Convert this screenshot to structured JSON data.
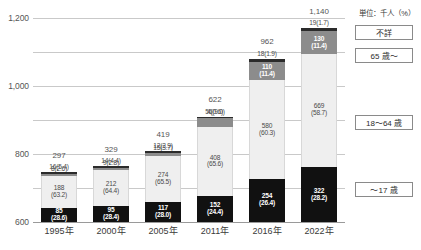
{
  "chart": {
    "type": "bar",
    "unit_note": "単位：千人（%）",
    "ylabel": "",
    "xlabel": ""
  },
  "yaxis": {
    "ticks": [
      "0",
      "200",
      "400",
      "600",
      "800",
      "1,000",
      "1,200"
    ],
    "min": 0,
    "max": 1200
  },
  "legend": {
    "items": [
      {
        "key": "unknown",
        "label": "不詳",
        "color": "#2b2b2b"
      },
      {
        "key": "age65",
        "label": "65 歳～",
        "color": "#8c8c8c"
      },
      {
        "key": "age1864",
        "label": "18～64 歳",
        "color": "#efefef"
      },
      {
        "key": "age17",
        "label": "～17 歳",
        "color": "#111111"
      }
    ]
  },
  "chart_data": {
    "type": "bar",
    "title": "",
    "subtitle": "",
    "xlabel": "",
    "ylabel": "千人",
    "ylim": [
      0,
      1200
    ],
    "grid": true,
    "stacked": true,
    "legend_position": "right",
    "categories": [
      "1995年",
      "2000年",
      "2005年",
      "2011年",
      "2016年",
      "2022年"
    ],
    "totals": [
      297,
      329,
      419,
      622,
      962,
      1140
    ],
    "total_labels": [
      "297",
      "329",
      "419",
      "622",
      "962",
      "1,140"
    ],
    "series": [
      {
        "name": "～17 歳",
        "color": "#111111",
        "values": [
          85,
          95,
          117,
          152,
          254,
          322
        ],
        "percents": [
          28.6,
          28.4,
          28.0,
          24.4,
          26.4,
          28.2
        ],
        "labels": [
          "85",
          "95",
          "117",
          "152",
          "254",
          "322"
        ],
        "pct_labels": [
          "(28.6)",
          "(28.4)",
          "(28.0)",
          "(24.4)",
          "(26.4)",
          "(28.2)"
        ]
      },
      {
        "name": "18～64 歳",
        "color": "#efefef",
        "values": [
          188,
          212,
          274,
          408,
          580,
          669
        ],
        "percents": [
          63.2,
          64.4,
          65.5,
          65.6,
          60.3,
          58.7
        ],
        "labels": [
          "188",
          "212",
          "274",
          "408",
          "580",
          "669"
        ],
        "pct_labels": [
          "(63.2)",
          "(64.4)",
          "(65.5)",
          "(65.6)",
          "(60.3)",
          "(58.7)"
        ]
      },
      {
        "name": "65 歳～",
        "color": "#8c8c8c",
        "values": [
          8,
          9,
          15,
          56,
          110,
          130
        ],
        "percents": [
          2.6,
          2.8,
          3.7,
          9.0,
          11.4,
          11.4
        ],
        "labels": [
          "8",
          "9",
          "15",
          "56",
          "110",
          "130"
        ],
        "pct_labels": [
          "(2.6)",
          "(2.8)",
          "(3.7)",
          "(9.0)",
          "(11.4)",
          "(11.4)"
        ]
      },
      {
        "name": "不詳",
        "color": "#2b2b2b",
        "values": [
          16,
          14,
          12,
          4,
          18,
          19
        ],
        "percents": [
          5.4,
          4.4,
          2.9,
          0.6,
          1.9,
          1.7
        ],
        "labels": [
          "16",
          "14",
          "12",
          "4",
          "18",
          "19"
        ],
        "pct_labels": [
          "(5.4)",
          "(4.4)",
          "(2.9)",
          "(0.6)",
          "(1.9)",
          "(1.7)"
        ]
      }
    ],
    "annotations": {
      "1995年": [
        "16(5.4)",
        "8(2.6)",
        "188 (63.2)",
        "85 (28.6)"
      ],
      "2000年": [
        "14(4.4)",
        "9(2.8)",
        "212 (64.4)",
        "95 (28.4)"
      ],
      "2005年": [
        "12(2.9)",
        "15(3.7)",
        "274 (65.5)",
        "117 (28.0)"
      ],
      "2011年": [
        "4(0.6)",
        "56(9.0)",
        "408 (65.6)",
        "152 (24.4)"
      ],
      "2016年": [
        "18(1.9)",
        "110 (11.4)",
        "580 (60.3)",
        "254 (26.4)"
      ],
      "2022年": [
        "19(1.7)",
        "130 (11.4)",
        "669 (58.7)",
        "322 (28.2)"
      ]
    }
  }
}
